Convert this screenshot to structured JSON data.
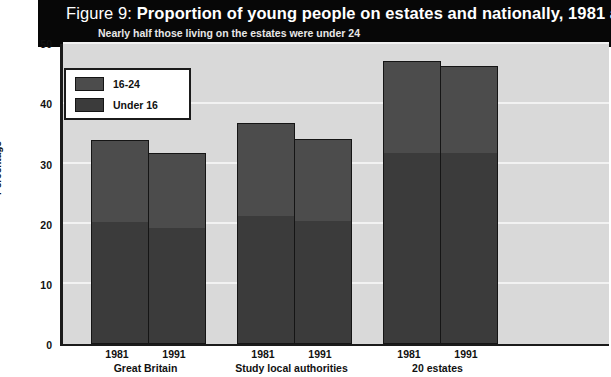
{
  "figure": {
    "label": "Figure 9:",
    "title": "Proportion of young people on estates and nationally, 1981 and 1991",
    "subtitle": "Nearly half those living on the estates were under 24"
  },
  "legend": {
    "items": [
      {
        "label": "16-24",
        "color": "#4c4c4c"
      },
      {
        "label": "Under 16",
        "color": "#3b3b3b"
      }
    ]
  },
  "axes": {
    "y_title": "Percentage",
    "y_ticks": [
      "0",
      "10",
      "20",
      "30",
      "40",
      "50"
    ]
  },
  "chart_data": {
    "type": "bar",
    "subtype": "stacked",
    "title": "Proportion of young people on estates and nationally, 1981 and 1991",
    "subtitle": "Nearly half those living on the estates were under 24",
    "xlabel": "",
    "ylabel": "Percentage",
    "ylim": [
      0,
      50
    ],
    "yticks": [
      0,
      10,
      20,
      30,
      40,
      50
    ],
    "grid": true,
    "legend_position": "inside-top-left",
    "groups": [
      "Great Britain",
      "Study local authorities",
      "20 estates"
    ],
    "categories": [
      "1981",
      "1991",
      "1981",
      "1991",
      "1981",
      "1991"
    ],
    "group_of_category": [
      "Great Britain",
      "Great Britain",
      "Study local authorities",
      "Study local authorities",
      "20 estates",
      "20 estates"
    ],
    "series": [
      {
        "name": "Under 16",
        "color": "#3b3b3b",
        "values": [
          20.1,
          19.1,
          21.1,
          20.4,
          31.6,
          31.6
        ]
      },
      {
        "name": "16-24",
        "color": "#4c4c4c",
        "values": [
          13.9,
          12.8,
          15.8,
          13.7,
          15.6,
          14.7
        ]
      }
    ],
    "totals": [
      34.0,
      31.9,
      36.9,
      34.1,
      47.2,
      46.3
    ]
  }
}
